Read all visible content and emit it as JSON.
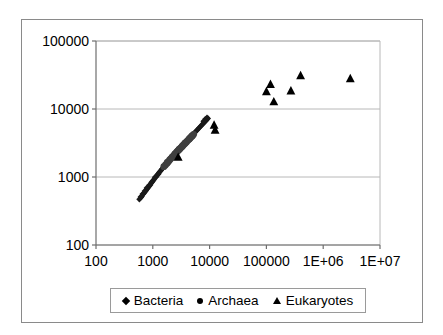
{
  "chart_data": {
    "type": "scatter",
    "title": "",
    "xlabel": "",
    "ylabel": "",
    "xscale": "log",
    "yscale": "log",
    "xlim": [
      100,
      10000000
    ],
    "ylim": [
      100,
      100000
    ],
    "grid": "horizontal",
    "legend_position": "bottom",
    "xticklabels": [
      "100",
      "1000",
      "10000",
      "100000",
      "1E+06",
      "1E+07"
    ],
    "xtickvalues": [
      100,
      1000,
      10000,
      100000,
      1000000,
      10000000
    ],
    "yticklabels": [
      "100",
      "1000",
      "10000",
      "100000"
    ],
    "ytickvalues": [
      100,
      1000,
      10000,
      100000
    ],
    "series": [
      {
        "name": "Bacteria",
        "marker": "diamond",
        "color": "#1a1a1a",
        "points": [
          [
            580,
            470
          ],
          [
            620,
            500
          ],
          [
            640,
            520
          ],
          [
            680,
            560
          ],
          [
            700,
            580
          ],
          [
            740,
            610
          ],
          [
            760,
            640
          ],
          [
            800,
            670
          ],
          [
            830,
            700
          ],
          [
            860,
            730
          ],
          [
            900,
            760
          ],
          [
            930,
            800
          ],
          [
            960,
            830
          ],
          [
            1000,
            870
          ],
          [
            1030,
            900
          ],
          [
            1070,
            940
          ],
          [
            1100,
            980
          ],
          [
            1150,
            1010
          ],
          [
            1180,
            1050
          ],
          [
            1220,
            1090
          ],
          [
            1260,
            1130
          ],
          [
            1300,
            1170
          ],
          [
            1350,
            1210
          ],
          [
            1400,
            1260
          ],
          [
            1450,
            1310
          ],
          [
            1500,
            1350
          ],
          [
            1560,
            1400
          ],
          [
            1620,
            1460
          ],
          [
            1680,
            1510
          ],
          [
            1750,
            1570
          ],
          [
            1820,
            1630
          ],
          [
            1900,
            1700
          ],
          [
            1980,
            1760
          ],
          [
            2050,
            1830
          ],
          [
            2140,
            1900
          ],
          [
            2230,
            1970
          ],
          [
            2320,
            2050
          ],
          [
            2420,
            2130
          ],
          [
            2520,
            2210
          ],
          [
            2630,
            2300
          ],
          [
            2740,
            2390
          ],
          [
            2860,
            2480
          ],
          [
            2980,
            2580
          ],
          [
            3110,
            2680
          ],
          [
            3240,
            2790
          ],
          [
            3380,
            2900
          ],
          [
            3530,
            3010
          ],
          [
            3680,
            3130
          ],
          [
            3840,
            3250
          ],
          [
            4000,
            3380
          ],
          [
            4180,
            3510
          ],
          [
            4360,
            3650
          ],
          [
            4540,
            3790
          ],
          [
            4740,
            3940
          ],
          [
            4940,
            4090
          ],
          [
            5160,
            4250
          ],
          [
            5380,
            4420
          ],
          [
            5610,
            4590
          ],
          [
            5860,
            4770
          ],
          [
            6110,
            4960
          ],
          [
            6380,
            5150
          ],
          [
            6650,
            5350
          ],
          [
            6940,
            5560
          ],
          [
            7250,
            5780
          ],
          [
            7560,
            6000
          ],
          [
            7890,
            6240
          ],
          [
            8230,
            6480
          ],
          [
            8600,
            6730
          ],
          [
            8970,
            6990
          ],
          [
            9360,
            7260
          ],
          [
            9000,
            7450
          ],
          [
            8400,
            7100
          ],
          [
            7800,
            6600
          ],
          [
            5000,
            4200
          ],
          [
            3000,
            2600
          ],
          [
            2000,
            1800
          ],
          [
            1250,
            1100
          ],
          [
            1100,
            1000
          ],
          [
            950,
            840
          ],
          [
            870,
            760
          ],
          [
            780,
            690
          ],
          [
            720,
            620
          ],
          [
            660,
            560
          ],
          [
            610,
            510
          ]
        ]
      },
      {
        "name": "Archaea",
        "marker": "circle",
        "color": "#3f3f3f",
        "points": [
          [
            1560,
            1420
          ],
          [
            1660,
            1490
          ],
          [
            1740,
            1560
          ],
          [
            1810,
            1620
          ],
          [
            1900,
            1700
          ],
          [
            1980,
            1780
          ],
          [
            2060,
            1850
          ],
          [
            2160,
            1930
          ],
          [
            2250,
            2000
          ],
          [
            2340,
            2080
          ],
          [
            2440,
            2160
          ],
          [
            2540,
            2240
          ],
          [
            2640,
            2330
          ],
          [
            2750,
            2420
          ],
          [
            2860,
            2500
          ],
          [
            2980,
            2590
          ],
          [
            3100,
            2680
          ],
          [
            3230,
            2780
          ],
          [
            3360,
            2880
          ],
          [
            3500,
            2980
          ],
          [
            3640,
            3090
          ],
          [
            3790,
            3200
          ],
          [
            3950,
            3310
          ],
          [
            4110,
            3430
          ],
          [
            4280,
            3550
          ],
          [
            4460,
            3680
          ],
          [
            4640,
            3810
          ],
          [
            4830,
            3950
          ],
          [
            5030,
            4090
          ],
          [
            5240,
            4240
          ],
          [
            2200,
            1960
          ],
          [
            2900,
            2540
          ],
          [
            3700,
            3140
          ],
          [
            4400,
            3620
          ],
          [
            1800,
            1640
          ],
          [
            2480,
            2190
          ],
          [
            3300,
            2820
          ],
          [
            4900,
            4000
          ]
        ]
      },
      {
        "name": "Eukaryotes",
        "marker": "triangle",
        "color": "#000000",
        "points": [
          [
            12000,
            5800
          ],
          [
            12500,
            4900
          ],
          [
            2800,
            1950
          ],
          [
            100000,
            18000
          ],
          [
            118000,
            23000
          ],
          [
            135000,
            12800
          ],
          [
            270000,
            18500
          ],
          [
            400000,
            31000
          ],
          [
            3000000,
            28000
          ]
        ]
      }
    ]
  },
  "legend": {
    "items": [
      {
        "label": "Bacteria",
        "marker": "diamond"
      },
      {
        "label": "Archaea",
        "marker": "circle"
      },
      {
        "label": "Eukaryotes",
        "marker": "triangle"
      }
    ]
  }
}
